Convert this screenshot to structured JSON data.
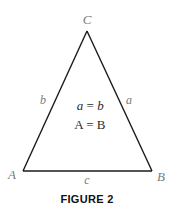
{
  "figure": {
    "caption": "FIGURE 2",
    "shape": "isosceles-triangle",
    "stroke_color": "#1a1a1a",
    "label_color": "#7a7a7a",
    "vertices": {
      "A": "A",
      "B": "B",
      "C": "C"
    },
    "sides": {
      "a": "a",
      "b": "b",
      "c": "c"
    },
    "equations": {
      "sides_equal": {
        "left": "a",
        "op": " = ",
        "right": "b"
      },
      "angles_equal": {
        "left": "A",
        "op": " = ",
        "right": "B"
      }
    }
  }
}
